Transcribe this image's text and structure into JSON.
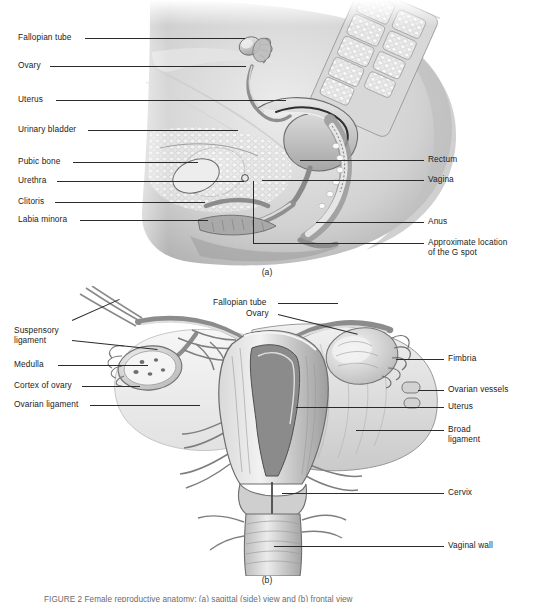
{
  "figure": {
    "panel_a_letter": "(a)",
    "panel_b_letter": "(b)",
    "caption": "FIGURE 2  Female reproductive anatomy: (a) sagittal (side) view and (b) frontal view"
  },
  "panel_a": {
    "view": "sagittal section of the female pelvis",
    "labels_left": [
      {
        "text": "Fallopian tube",
        "y": 38
      },
      {
        "text": "Ovary",
        "y": 66
      },
      {
        "text": "Uterus",
        "y": 100
      },
      {
        "text": "Urinary bladder",
        "y": 130
      },
      {
        "text": "Pubic bone",
        "y": 162
      },
      {
        "text": "Urethra",
        "y": 181
      },
      {
        "text": "Clitoris",
        "y": 202
      },
      {
        "text": "Labia minora",
        "y": 220
      }
    ],
    "labels_right": [
      {
        "text": "Rectum",
        "y": 160
      },
      {
        "text": "Vagina",
        "y": 180
      },
      {
        "text": "Anus",
        "y": 222
      },
      {
        "text": "Approximate location",
        "y": 243
      },
      {
        "text": "of the G spot",
        "y": 253
      }
    ]
  },
  "panel_b": {
    "view": "frontal (coronal) view of uterus, fallopian tubes and ovaries",
    "labels_left": [
      {
        "text": "Suspensory",
        "y": 331
      },
      {
        "text": "ligament",
        "y": 341
      },
      {
        "text": "Medulla",
        "y": 365
      },
      {
        "text": "Cortex of ovary",
        "y": 386
      },
      {
        "text": "Ovarian ligament",
        "y": 405
      }
    ],
    "labels_center": [
      {
        "text": "Fallopian tube",
        "y": 303
      },
      {
        "text": "Ovary",
        "y": 314
      }
    ],
    "labels_right": [
      {
        "text": "Fimbria",
        "y": 359
      },
      {
        "text": "Ovarian vessels",
        "y": 390
      },
      {
        "text": "Uterus",
        "y": 407
      },
      {
        "text": "Broad",
        "y": 430
      },
      {
        "text": "ligament",
        "y": 440
      },
      {
        "text": "Cervix",
        "y": 493
      },
      {
        "text": "Vaginal wall",
        "y": 546
      }
    ]
  },
  "colors": {
    "ink": "#1b1b1b",
    "leader": "#2b2b2b",
    "tissue_light": "#e3e3e3",
    "tissue_mid": "#b8b8b8",
    "tissue_dark": "#8a8a8a",
    "outline": "#5a5a5a",
    "background": "#ffffff"
  }
}
